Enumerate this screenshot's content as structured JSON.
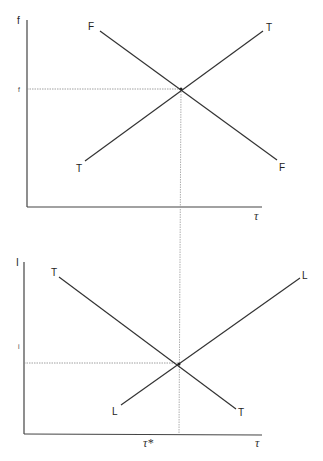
{
  "diagram": {
    "type": "two-panel supply-demand style equilibrium diagram",
    "top_panel": {
      "y_axis_label": "f",
      "x_axis_label": "τ",
      "tick_label_y": "f",
      "curves": [
        {
          "name": "F",
          "start_label": "F",
          "end_label": "F",
          "slope": "downward"
        },
        {
          "name": "T",
          "start_label": "T",
          "end_label": "T",
          "slope": "upward"
        }
      ]
    },
    "bottom_panel": {
      "y_axis_label": "I",
      "x_axis_label": "τ",
      "tick_label_y": "i",
      "tick_label_x": "τ*",
      "curves": [
        {
          "name": "T",
          "start_label": "T",
          "end_label": "T",
          "slope": "downward"
        },
        {
          "name": "L",
          "start_label": "L",
          "end_label": "L",
          "slope": "upward"
        }
      ]
    },
    "colors": {
      "line": "#333333",
      "dashed": "#888888",
      "background": "#ffffff"
    }
  }
}
